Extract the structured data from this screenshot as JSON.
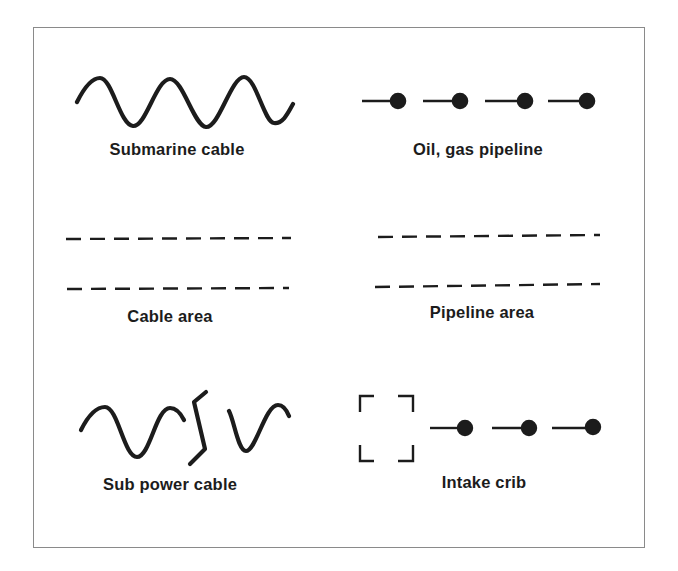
{
  "legend": {
    "title": "",
    "items": [
      {
        "id": "submarine-cable",
        "label": "Submarine cable",
        "symbol": "wavy-line"
      },
      {
        "id": "oil-gas-pipeline",
        "label": "Oil, gas pipeline",
        "symbol": "line-segments-with-dots"
      },
      {
        "id": "cable-area",
        "label": "Cable area",
        "symbol": "double-dashed-lines"
      },
      {
        "id": "pipeline-area",
        "label": "Pipeline area",
        "symbol": "double-dashed-lines"
      },
      {
        "id": "sub-power-cable",
        "label": "Sub power cable",
        "symbol": "wavy-line-with-break"
      },
      {
        "id": "intake-crib",
        "label": "Intake crib",
        "symbol": "corner-brackets-with-dotted-segments"
      }
    ]
  },
  "colors": {
    "ink": "#1c1c1c",
    "frame": "#8a8a8a",
    "background": "#ffffff"
  }
}
